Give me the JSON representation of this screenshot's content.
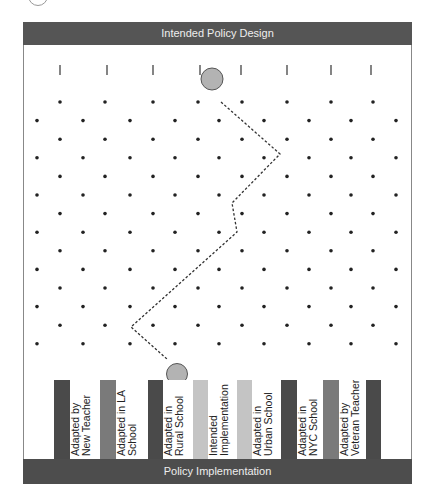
{
  "diagram": {
    "top_label": "Intended Policy Design",
    "bottom_label": "Policy Implementation",
    "colors": {
      "dark": "#4a4a4a",
      "mid": "#7a7a7a",
      "light": "#c4c4c4",
      "ball": "#b3b3b3"
    },
    "bins": [
      {
        "label": "Adapted by\nNew Teacher"
      },
      {
        "label": "Adapted in LA\nSchool"
      },
      {
        "label": "Adapted in\nRural School"
      },
      {
        "label": "Intended\nImplementation"
      },
      {
        "label": "Adapted in\nUrban School"
      },
      {
        "label": "Adapted in\nNYC School"
      },
      {
        "label": "Adapted by\nVeteran Teacher"
      }
    ]
  }
}
